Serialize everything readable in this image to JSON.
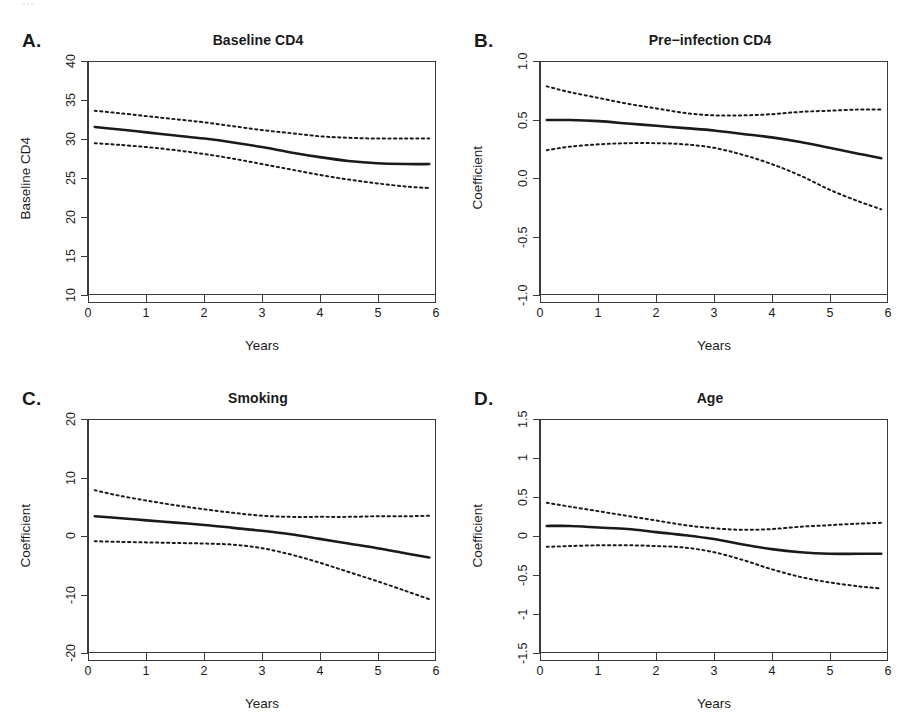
{
  "figure": {
    "running_header": "...",
    "x_axis_label": "Years",
    "x_ticks": [
      "0",
      "1",
      "2",
      "3",
      "4",
      "5",
      "6"
    ],
    "line_color": "#1a1a1a",
    "background": "#ffffff"
  },
  "panels": [
    {
      "letter": "A.",
      "title": "Baseline CD4",
      "y_axis_label": "Baseline CD4",
      "y_ticks": [
        "10",
        "15",
        "20",
        "25",
        "30",
        "35",
        "40"
      ]
    },
    {
      "letter": "B.",
      "title": "Pre−infection CD4",
      "y_axis_label": "Coefficient",
      "y_ticks": [
        "-1.0",
        "-0.5",
        "0.0",
        "0.5",
        "1.0"
      ]
    },
    {
      "letter": "C.",
      "title": "Smoking",
      "y_axis_label": "Coefficient",
      "y_ticks": [
        "-20",
        "-10",
        "0",
        "10",
        "20"
      ]
    },
    {
      "letter": "D.",
      "title": "Age",
      "y_axis_label": "Coefficient",
      "y_ticks": [
        "-1.5",
        "-1",
        "-0.5",
        "0",
        "0.5",
        "1",
        "1.5"
      ]
    }
  ],
  "chart_data": [
    {
      "type": "line",
      "panel": "A",
      "title": "Baseline CD4",
      "xlabel": "Years",
      "ylabel": "Baseline CD4",
      "xlim": [
        0,
        6
      ],
      "ylim": [
        10,
        40
      ],
      "yticks": [
        10,
        15,
        20,
        25,
        30,
        35,
        40
      ],
      "xticks": [
        0,
        1,
        2,
        3,
        4,
        5,
        6
      ],
      "grid": false,
      "legend": "none",
      "x": [
        0.1,
        0.5,
        1.0,
        1.5,
        2.0,
        2.5,
        3.0,
        3.5,
        4.0,
        4.5,
        5.0,
        5.5,
        5.9
      ],
      "series": [
        {
          "name": "estimate",
          "style": "solid",
          "values": [
            31.6,
            31.3,
            30.9,
            30.5,
            30.1,
            29.6,
            29.0,
            28.3,
            27.7,
            27.2,
            26.9,
            26.8,
            26.8
          ]
        },
        {
          "name": "upper 95% CI",
          "style": "dashed",
          "values": [
            33.7,
            33.4,
            33.0,
            32.6,
            32.2,
            31.7,
            31.2,
            30.8,
            30.4,
            30.2,
            30.1,
            30.1,
            30.1
          ]
        },
        {
          "name": "lower 95% CI",
          "style": "dashed",
          "values": [
            29.5,
            29.3,
            29.0,
            28.6,
            28.1,
            27.5,
            26.8,
            26.1,
            25.4,
            24.8,
            24.3,
            23.9,
            23.7
          ]
        }
      ]
    },
    {
      "type": "line",
      "panel": "B",
      "title": "Pre−infection CD4",
      "xlabel": "Years",
      "ylabel": "Coefficient",
      "xlim": [
        0,
        6
      ],
      "ylim": [
        -1.0,
        1.0
      ],
      "yticks": [
        -1.0,
        -0.5,
        0.0,
        0.5,
        1.0
      ],
      "xticks": [
        0,
        1,
        2,
        3,
        4,
        5,
        6
      ],
      "grid": false,
      "legend": "none",
      "x": [
        0.1,
        0.5,
        1.0,
        1.5,
        2.0,
        2.5,
        3.0,
        3.5,
        4.0,
        4.5,
        5.0,
        5.5,
        5.9
      ],
      "series": [
        {
          "name": "estimate",
          "style": "solid",
          "values": [
            0.5,
            0.5,
            0.49,
            0.47,
            0.45,
            0.43,
            0.41,
            0.38,
            0.35,
            0.31,
            0.26,
            0.21,
            0.17
          ]
        },
        {
          "name": "upper 95% CI",
          "style": "dashed",
          "values": [
            0.79,
            0.74,
            0.69,
            0.64,
            0.6,
            0.56,
            0.54,
            0.54,
            0.55,
            0.57,
            0.58,
            0.59,
            0.59
          ]
        },
        {
          "name": "lower 95% CI",
          "style": "dashed",
          "values": [
            0.24,
            0.27,
            0.29,
            0.3,
            0.3,
            0.29,
            0.26,
            0.2,
            0.12,
            0.02,
            -0.1,
            -0.2,
            -0.27
          ]
        }
      ]
    },
    {
      "type": "line",
      "panel": "C",
      "title": "Smoking",
      "xlabel": "Years",
      "ylabel": "Coefficient",
      "xlim": [
        0,
        6
      ],
      "ylim": [
        -20,
        20
      ],
      "yticks": [
        -20,
        -10,
        0,
        10,
        20
      ],
      "xticks": [
        0,
        1,
        2,
        3,
        4,
        5,
        6
      ],
      "grid": false,
      "legend": "none",
      "x": [
        0.1,
        0.5,
        1.0,
        1.5,
        2.0,
        2.5,
        3.0,
        3.5,
        4.0,
        4.5,
        5.0,
        5.5,
        5.9
      ],
      "series": [
        {
          "name": "estimate",
          "style": "solid",
          "values": [
            3.4,
            3.1,
            2.7,
            2.3,
            1.9,
            1.4,
            0.9,
            0.3,
            -0.5,
            -1.3,
            -2.1,
            -3.0,
            -3.7
          ]
        },
        {
          "name": "upper 95% CI",
          "style": "dashed",
          "values": [
            7.9,
            7.0,
            6.1,
            5.3,
            4.6,
            4.0,
            3.5,
            3.3,
            3.3,
            3.3,
            3.4,
            3.4,
            3.5
          ]
        },
        {
          "name": "lower 95% CI",
          "style": "dashed",
          "values": [
            -0.9,
            -1.0,
            -1.1,
            -1.2,
            -1.3,
            -1.5,
            -2.1,
            -3.2,
            -4.6,
            -6.2,
            -7.8,
            -9.5,
            -10.9
          ]
        }
      ]
    },
    {
      "type": "line",
      "panel": "D",
      "title": "Age",
      "xlabel": "Years",
      "ylabel": "Coefficient",
      "xlim": [
        0,
        6
      ],
      "ylim": [
        -1.5,
        1.5
      ],
      "yticks": [
        -1.5,
        -1,
        -0.5,
        0,
        0.5,
        1,
        1.5
      ],
      "xticks": [
        0,
        1,
        2,
        3,
        4,
        5,
        6
      ],
      "grid": false,
      "legend": "none",
      "x": [
        0.1,
        0.5,
        1.0,
        1.5,
        2.0,
        2.5,
        3.0,
        3.5,
        4.0,
        4.5,
        5.0,
        5.5,
        5.9
      ],
      "series": [
        {
          "name": "estimate",
          "style": "solid",
          "values": [
            0.13,
            0.13,
            0.11,
            0.09,
            0.05,
            0.01,
            -0.04,
            -0.11,
            -0.17,
            -0.21,
            -0.23,
            -0.23,
            -0.23
          ]
        },
        {
          "name": "upper 95% CI",
          "style": "dashed",
          "values": [
            0.43,
            0.38,
            0.32,
            0.26,
            0.2,
            0.14,
            0.1,
            0.08,
            0.09,
            0.12,
            0.14,
            0.16,
            0.17
          ]
        },
        {
          "name": "lower 95% CI",
          "style": "dashed",
          "values": [
            -0.14,
            -0.13,
            -0.12,
            -0.12,
            -0.13,
            -0.15,
            -0.21,
            -0.31,
            -0.43,
            -0.53,
            -0.6,
            -0.65,
            -0.68
          ]
        }
      ]
    }
  ]
}
